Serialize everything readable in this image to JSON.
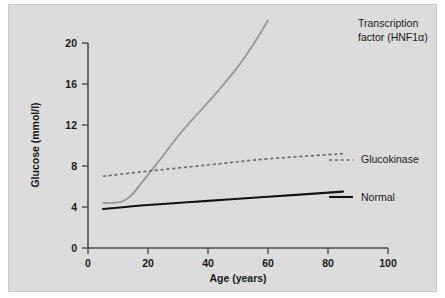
{
  "figure": {
    "background_color": "#dcdcdc",
    "page_color": "#ffffff"
  },
  "chart_data": {
    "type": "line",
    "title": "",
    "xlabel": "Age (years)",
    "ylabel": "Glucose (mmol/l)",
    "xlim": [
      0,
      100
    ],
    "ylim": [
      0,
      20
    ],
    "xticks": [
      0,
      20,
      40,
      60,
      80,
      100
    ],
    "yticks": [
      0,
      4,
      8,
      12,
      16,
      20
    ],
    "xtick_labels": [
      "0",
      "20",
      "40",
      "60",
      "80",
      "100"
    ],
    "ytick_labels": [
      "0",
      "4",
      "8",
      "12",
      "16",
      "20"
    ],
    "grid": false,
    "legend_position": "inline-right",
    "series": [
      {
        "name": "Transcription factor (HNF1α)",
        "label_lines": [
          "Transcription",
          "factor (HNF1α)"
        ],
        "style": "solid",
        "color": "#9a9a9a",
        "x": [
          5,
          8,
          11,
          13,
          15,
          18,
          21,
          25,
          30,
          35,
          40,
          45,
          50,
          55,
          60
        ],
        "y": [
          4.4,
          4.4,
          4.5,
          4.8,
          5.3,
          6.4,
          7.5,
          9.0,
          10.9,
          12.6,
          14.2,
          15.9,
          17.7,
          19.8,
          22.2
        ]
      },
      {
        "name": "Glucokinase",
        "label_lines": [
          "Glucokinase"
        ],
        "style": "dashed",
        "color": "#6e6e6e",
        "x": [
          5,
          20,
          40,
          60,
          85
        ],
        "y": [
          7.0,
          7.5,
          8.1,
          8.7,
          9.2
        ]
      },
      {
        "name": "Normal",
        "label_lines": [
          "Normal"
        ],
        "style": "solid",
        "color": "#141414",
        "x": [
          5,
          20,
          40,
          60,
          85
        ],
        "y": [
          3.8,
          4.2,
          4.6,
          5.0,
          5.5
        ]
      }
    ],
    "annotations": [
      {
        "text": "Transcription factor (HNF1α)",
        "lines": [
          "Transcription",
          "factor (HNF1α)"
        ],
        "x_px": 349,
        "y_px": 22
      },
      {
        "text": "Glucokinase",
        "lines": [
          "Glucokinase"
        ],
        "x_px": 352,
        "y_px": 158
      },
      {
        "text": "Normal",
        "lines": [
          "Normal"
        ],
        "x_px": 352,
        "y_px": 196
      }
    ]
  }
}
